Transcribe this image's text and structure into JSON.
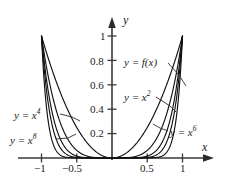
{
  "chart_data": {
    "type": "line",
    "title": "",
    "xlabel": "x",
    "ylabel": "y",
    "xlim": [
      -1.12,
      1.16
    ],
    "ylim": [
      -0.08,
      1.12
    ],
    "grid": false,
    "legend": "inline-callouts",
    "x_ticks": [
      {
        "value": -1,
        "label": "−1"
      },
      {
        "value": -0.5,
        "label": "−0.5"
      },
      {
        "value": 0.5,
        "label": "0.5"
      },
      {
        "value": 1,
        "label": "1"
      }
    ],
    "y_ticks": [
      {
        "value": 0.2,
        "label": "0.2"
      },
      {
        "value": 0.4,
        "label": "0.4"
      },
      {
        "value": 0.6,
        "label": "0.6"
      },
      {
        "value": 0.8,
        "label": "0.8"
      },
      {
        "value": 1,
        "label": "1"
      }
    ],
    "series": [
      {
        "name": "y = x^2",
        "exponent": 2,
        "label": "y = x",
        "sup": "2",
        "color": "#111111",
        "points_x": [
          -1,
          -0.9,
          -0.8,
          -0.7,
          -0.6,
          -0.5,
          -0.4,
          -0.3,
          -0.2,
          -0.1,
          0,
          0.1,
          0.2,
          0.3,
          0.4,
          0.5,
          0.6,
          0.7,
          0.8,
          0.9,
          1
        ],
        "points_y": [
          1,
          0.81,
          0.64,
          0.49,
          0.36,
          0.25,
          0.16,
          0.09,
          0.04,
          0.01,
          0,
          0.01,
          0.04,
          0.09,
          0.16,
          0.25,
          0.36,
          0.49,
          0.64,
          0.81,
          1
        ]
      },
      {
        "name": "y = x^4",
        "exponent": 4,
        "label": "y = x",
        "sup": "4",
        "color": "#111111",
        "points_x": [
          -1,
          -0.9,
          -0.8,
          -0.7,
          -0.6,
          -0.5,
          -0.4,
          -0.3,
          -0.2,
          -0.1,
          0,
          0.1,
          0.2,
          0.3,
          0.4,
          0.5,
          0.6,
          0.7,
          0.8,
          0.9,
          1
        ],
        "points_y": [
          1,
          0.6561,
          0.4096,
          0.2401,
          0.1296,
          0.0625,
          0.0256,
          0.0081,
          0.0016,
          0.0001,
          0,
          0.0001,
          0.0016,
          0.0081,
          0.0256,
          0.0625,
          0.1296,
          0.2401,
          0.4096,
          0.6561,
          1
        ]
      },
      {
        "name": "y = x^6",
        "exponent": 6,
        "label": "y = x",
        "sup": "6",
        "color": "#111111",
        "points_x": [
          -1,
          -0.9,
          -0.8,
          -0.7,
          -0.6,
          -0.5,
          -0.4,
          -0.3,
          -0.2,
          -0.1,
          0,
          0.1,
          0.2,
          0.3,
          0.4,
          0.5,
          0.6,
          0.7,
          0.8,
          0.9,
          1
        ],
        "points_y": [
          1,
          0.5314,
          0.2621,
          0.1176,
          0.0467,
          0.0156,
          0.0041,
          0.0007,
          0.0001,
          0,
          0,
          0,
          0.0001,
          0.0007,
          0.0041,
          0.0156,
          0.0467,
          0.1176,
          0.2621,
          0.5314,
          1
        ]
      },
      {
        "name": "y = x^8",
        "exponent": 8,
        "label": "y = x",
        "sup": "8",
        "color": "#111111",
        "points_x": [
          -1,
          -0.9,
          -0.8,
          -0.7,
          -0.6,
          -0.5,
          -0.4,
          -0.3,
          -0.2,
          -0.1,
          0,
          0.1,
          0.2,
          0.3,
          0.4,
          0.5,
          0.6,
          0.7,
          0.8,
          0.9,
          1
        ],
        "points_y": [
          1,
          0.4305,
          0.1678,
          0.0576,
          0.0168,
          0.0039,
          0.0007,
          0.0001,
          0,
          0,
          0,
          0,
          0,
          0.0001,
          0.0007,
          0.0039,
          0.0168,
          0.0576,
          0.1678,
          0.4305,
          1
        ]
      },
      {
        "name": "y = f(x)",
        "exponent": 12,
        "label": "y = f(x)",
        "sup": "",
        "color": "#111111",
        "points_x": [
          -1,
          -0.9,
          -0.8,
          -0.7,
          -0.6,
          -0.5,
          -0.4,
          -0.3,
          -0.2,
          -0.1,
          0,
          0.1,
          0.2,
          0.3,
          0.4,
          0.5,
          0.6,
          0.7,
          0.8,
          0.9,
          1
        ],
        "points_y": [
          1,
          0.2824,
          0.0687,
          0.0138,
          0.0022,
          0.0002,
          0,
          0,
          0,
          0,
          0,
          0,
          0,
          0,
          0,
          0.0002,
          0.0022,
          0.0138,
          0.0687,
          0.2824,
          1
        ]
      }
    ],
    "annotations": [
      {
        "id": "fx",
        "text": "y = f(x)",
        "sup": ""
      },
      {
        "id": "x2",
        "text": "y = x",
        "sup": "2"
      },
      {
        "id": "x4",
        "text": "y = x",
        "sup": "4"
      },
      {
        "id": "x6",
        "text": "y = x",
        "sup": "6"
      },
      {
        "id": "x8",
        "text": "y = x",
        "sup": "8"
      }
    ]
  },
  "axes": {
    "x_axis_name": "x",
    "y_axis_name": "y"
  },
  "colors": {
    "curve": "#111111",
    "axis": "#3a3a3a",
    "background": "#ffffff",
    "text": "#1a1a1a"
  }
}
